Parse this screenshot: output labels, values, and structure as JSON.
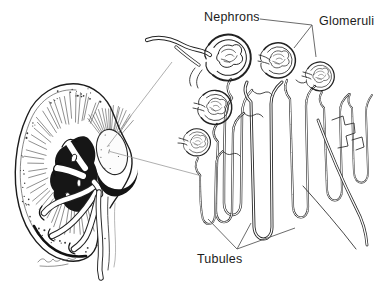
{
  "figure": {
    "kind": "anatomical line illustration",
    "background_color": "#ffffff",
    "ink_color": "#1f1f1f",
    "leader_line_color": "#5a5a5a",
    "callout_line_color": "#9a9a9a"
  },
  "labels": {
    "nephrons": "Nephrons",
    "glomeruli": "Glomeruli",
    "tubules": "Tubules"
  }
}
